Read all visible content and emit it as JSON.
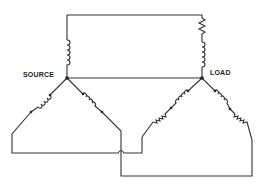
{
  "diagram": {
    "type": "circuit",
    "labels": {
      "source": "SOURCE",
      "load": "LOAD"
    },
    "nodes": [
      {
        "id": "source-neutral",
        "label": "SOURCE"
      },
      {
        "id": "load-neutral",
        "label": "LOAD"
      }
    ],
    "components": {
      "source_phases": [
        "inductor",
        "inductor"
      ],
      "source_neutral_line": [
        "inductor"
      ],
      "load_neutral_line": [
        "resistor",
        "inductor"
      ],
      "load_phases": [
        "inductor+resistor",
        "inductor+resistor"
      ]
    },
    "colors": {
      "line": "#333333",
      "background": "#ffffff"
    }
  }
}
